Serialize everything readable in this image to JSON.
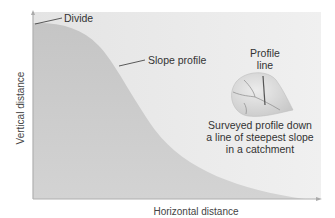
{
  "diagram": {
    "type": "hillslope-profile",
    "axes": {
      "x_label": "Horizontal distance",
      "y_label": "Vertical distance"
    },
    "annotations": {
      "divide": "Divide",
      "slope_profile": "Slope profile",
      "profile_line": "Profile line",
      "profile_line_1": "Profile",
      "profile_line_2": "line",
      "caption_1": "Surveyed profile down",
      "caption_2": "a line of steepest slope",
      "caption_3": "in a catchment"
    },
    "colors": {
      "background": "#e9e9e9",
      "profile_fill": "#c9c9c9",
      "axis": "#b5b5b5",
      "leader": "#333333",
      "catchment": "#d6d6d6"
    }
  }
}
